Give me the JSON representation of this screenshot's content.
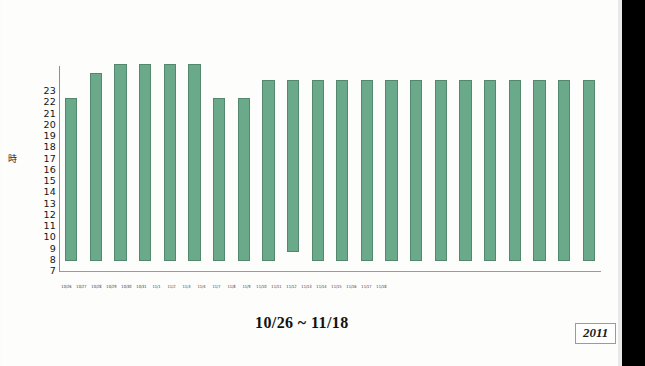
{
  "chart_data": {
    "type": "bar",
    "title": "10/26 ~ 11/18",
    "xlabel": "",
    "ylabel": "時",
    "ylim": [
      7,
      23
    ],
    "ytick_labels": [
      "23",
      "22",
      "21",
      "20",
      "19",
      "18",
      "17",
      "16",
      "15",
      "14",
      "13",
      "12",
      "11",
      "10",
      "9",
      "8",
      "7"
    ],
    "grid": false,
    "legend": "none",
    "year_badge": "2011",
    "bar_color": "#6aa98a",
    "bar_edge_color": "#54886e",
    "note": "Each bar spans from its start hour to its end hour on the vertical 'hour' axis; most bars run the full 7-to-22.5 range.",
    "categories": [
      "10/26",
      "10/27",
      "10/28",
      "10/29",
      "10/30",
      "10/31",
      "11/1",
      "11/2",
      "11/3",
      "11/4",
      "11/7",
      "11/8",
      "11/9",
      "11/10",
      "11/11",
      "11/12",
      "11/13",
      "11/14",
      "11/15",
      "11/16",
      "11/17",
      "11/18"
    ],
    "values": [
      21.0,
      23.2,
      24.0,
      24.0,
      24.0,
      24.0,
      21.0,
      21.0,
      22.6,
      22.6,
      22.6,
      22.6,
      22.6,
      22.6,
      22.6,
      22.6,
      22.6,
      22.6,
      22.6,
      22.6,
      22.6,
      22.6
    ],
    "bar_starts": [
      7,
      7,
      7,
      7,
      7,
      7,
      7,
      7,
      7,
      7.8,
      7,
      7,
      7,
      7,
      7,
      7,
      7,
      7,
      7,
      7,
      7,
      7
    ],
    "bars": [
      {
        "label": "10/26",
        "start": 7,
        "end": 21.0
      },
      {
        "label": "10/27",
        "start": 7,
        "end": 23.2
      },
      {
        "label": "10/28",
        "start": 7,
        "end": 24.0
      },
      {
        "label": "10/29",
        "start": 7,
        "end": 24.0
      },
      {
        "label": "10/30",
        "start": 7,
        "end": 24.0
      },
      {
        "label": "10/31",
        "start": 7,
        "end": 24.0
      },
      {
        "label": "11/1",
        "start": 7,
        "end": 21.0
      },
      {
        "label": "11/2",
        "start": 7,
        "end": 21.0
      },
      {
        "label": "11/3",
        "start": 7,
        "end": 22.6
      },
      {
        "label": "11/4",
        "start": 7.8,
        "end": 22.6
      },
      {
        "label": "11/7",
        "start": 7,
        "end": 22.6
      },
      {
        "label": "11/8",
        "start": 7,
        "end": 22.6
      },
      {
        "label": "11/9",
        "start": 7,
        "end": 22.6
      },
      {
        "label": "11/10",
        "start": 7,
        "end": 22.6
      },
      {
        "label": "11/11",
        "start": 7,
        "end": 22.6
      },
      {
        "label": "11/12",
        "start": 7,
        "end": 22.6
      },
      {
        "label": "11/13",
        "start": 7,
        "end": 22.6
      },
      {
        "label": "11/14",
        "start": 7,
        "end": 22.6
      },
      {
        "label": "11/15",
        "start": 7,
        "end": 22.6
      },
      {
        "label": "11/16",
        "start": 7,
        "end": 22.6
      },
      {
        "label": "11/17",
        "start": 7,
        "end": 22.6
      },
      {
        "label": "11/18",
        "start": 7,
        "end": 22.6
      }
    ],
    "x_tick_labels": [
      "10/26",
      "10/27",
      "10/28",
      "10/29",
      "10/30",
      "10/31",
      "11/1",
      "11/2",
      "11/3",
      "11/4",
      "11/7",
      "11/8",
      "11/9",
      "11/10",
      "11/11",
      "11/12",
      "11/13",
      "11/14",
      "11/15",
      "11/16",
      "11/17",
      "11/18"
    ]
  }
}
